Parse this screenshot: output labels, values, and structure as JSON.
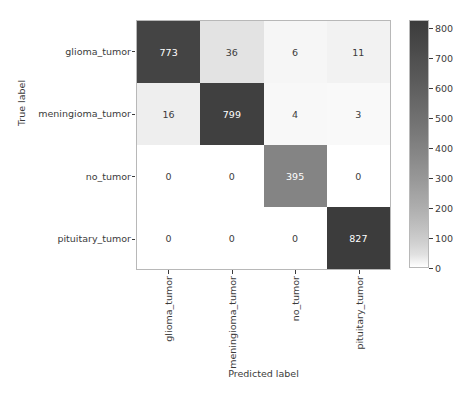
{
  "chart_data": {
    "type": "heatmap",
    "subtype": "confusion-matrix",
    "title": "",
    "xlabel": "Predicted label",
    "ylabel": "True label",
    "categories": [
      "glioma_tumor",
      "meningioma_tumor",
      "no_tumor",
      "pituitary_tumor"
    ],
    "x_tick_labels": [
      "glioma_tumor",
      "meningioma_tumor",
      "no_tumor",
      "pituitary_tumor"
    ],
    "y_tick_labels": [
      "glioma_tumor",
      "meningioma_tumor",
      "no_tumor",
      "pituitary_tumor"
    ],
    "rows": [
      {
        "label": "glioma_tumor",
        "values": [
          773,
          36,
          6,
          11
        ]
      },
      {
        "label": "meningioma_tumor",
        "values": [
          16,
          799,
          4,
          3
        ]
      },
      {
        "label": "no_tumor",
        "values": [
          0,
          0,
          395,
          0
        ]
      },
      {
        "label": "pituitary_tumor",
        "values": [
          0,
          0,
          0,
          827
        ]
      }
    ],
    "matrix": [
      [
        773,
        36,
        6,
        11
      ],
      [
        16,
        799,
        4,
        3
      ],
      [
        0,
        0,
        395,
        0
      ],
      [
        0,
        0,
        0,
        827
      ]
    ],
    "colorbar": {
      "ticks": [
        0,
        100,
        200,
        300,
        400,
        500,
        600,
        700,
        800
      ],
      "tick_labels": [
        "0",
        "100",
        "200",
        "300",
        "400",
        "500",
        "600",
        "700",
        "800"
      ],
      "vmin": 0,
      "vmax": 827,
      "colormap": "Greys",
      "position": "right",
      "low_color": "#ffffff",
      "high_color": "#414142"
    },
    "grid": false,
    "legend": "none"
  },
  "style": {
    "text_color": "#3b3b3b",
    "cell_dark_text": "#ffffff",
    "cell_light_text": "#3b3b3b",
    "axis_line_color": "#b8b8b8",
    "background": "#ffffff"
  }
}
